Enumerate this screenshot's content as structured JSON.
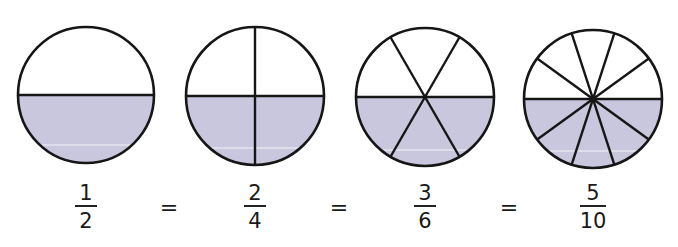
{
  "diagram": {
    "colors": {
      "fill": "#c9c7dd",
      "stroke": "#161616",
      "background": "#ffffff",
      "highlight_line": "#ffffff"
    },
    "circles": [
      {
        "id": "half",
        "cx": 86,
        "cy": 95,
        "r": 68,
        "divisions": 2,
        "shaded": 1,
        "horizontal_y": 94
      },
      {
        "id": "quarter",
        "cx": 255,
        "cy": 96,
        "r": 69,
        "divisions": 4,
        "shaded": 2,
        "horizontal_y": 96
      },
      {
        "id": "sixth",
        "cx": 425,
        "cy": 97,
        "r": 69,
        "divisions": 6,
        "shaded": 3,
        "horizontal_y": 98
      },
      {
        "id": "tenth",
        "cx": 593,
        "cy": 99,
        "r": 69,
        "divisions": 10,
        "shaded": 5,
        "horizontal_y": 99
      }
    ],
    "fractions": [
      {
        "numerator": "1",
        "denominator": "2",
        "x": 86
      },
      {
        "numerator": "2",
        "denominator": "4",
        "x": 255
      },
      {
        "numerator": "3",
        "denominator": "6",
        "x": 425
      },
      {
        "numerator": "5",
        "denominator": "10",
        "x": 593
      }
    ],
    "equals": [
      {
        "symbol": "=",
        "x": 169
      },
      {
        "symbol": "=",
        "x": 339
      },
      {
        "symbol": "=",
        "x": 509
      }
    ]
  }
}
